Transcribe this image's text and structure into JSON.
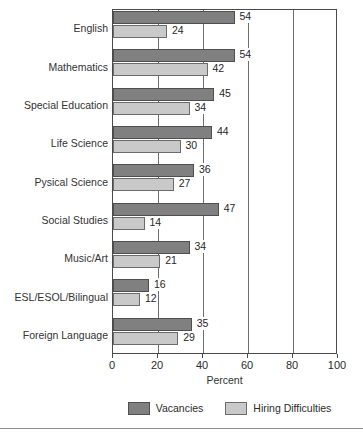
{
  "chart_data": {
    "type": "bar",
    "orientation": "horizontal",
    "title": "",
    "xlabel": "Percent",
    "ylabel": "",
    "xlim": [
      0,
      100
    ],
    "xticks": [
      0,
      20,
      40,
      60,
      80,
      100
    ],
    "grid": true,
    "grid_axis": "x",
    "legend_position": "bottom",
    "categories": [
      "English",
      "Mathematics",
      "Special Education",
      "Life Science",
      "Pysical Science",
      "Social Studies",
      "Music/Art",
      "ESL/ESOL/Bilingual",
      "Foreign Language"
    ],
    "series": [
      {
        "name": "Vacancies",
        "color": "#808080",
        "values": [
          54,
          54,
          45,
          44,
          36,
          47,
          34,
          16,
          35
        ]
      },
      {
        "name": "Hiring Difficulties",
        "color": "#c9c9c9",
        "values": [
          24,
          42,
          34,
          30,
          27,
          14,
          21,
          12,
          29
        ]
      }
    ]
  },
  "axis": {
    "x_title": "Percent",
    "tick_labels": [
      "0",
      "20",
      "40",
      "60",
      "80",
      "100"
    ]
  },
  "legend": {
    "entries": [
      {
        "label": "Vacancies",
        "swatch": "vacancies"
      },
      {
        "label": "Hiring Difficulties",
        "swatch": "hiring"
      }
    ]
  },
  "footer": {
    "caption": ""
  }
}
